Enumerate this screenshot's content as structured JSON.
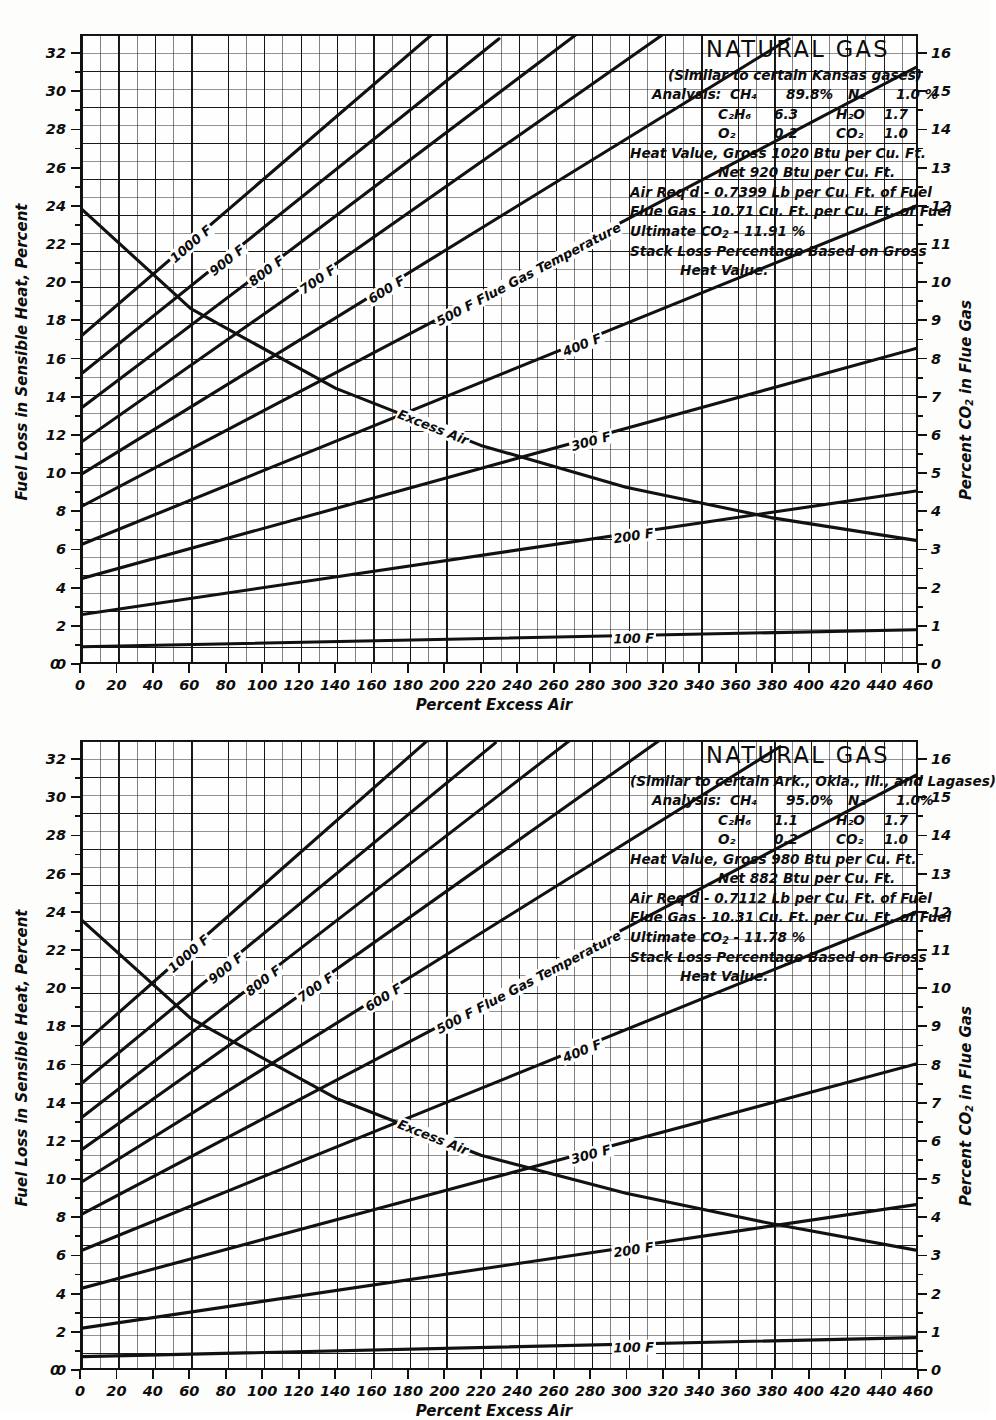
{
  "charts": [
    {
      "id": "chart-1",
      "title": "NATURAL GAS",
      "subtitle": "(Similar to certain Kansas gases)",
      "analysis_label": "Analysis:",
      "analysis": [
        {
          "sp1": "CH₄",
          "v1": "89.8%",
          "sp2": "N₂",
          "v2": "1.0 %"
        },
        {
          "sp1": "C₂H₆",
          "v1": "6.3",
          "sp2": "H₂O",
          "v2": "1.7"
        },
        {
          "sp1": "O₂",
          "v1": "0.2",
          "sp2": "CO₂",
          "v2": "1.0"
        }
      ],
      "heat_value_gross": "Heat Value, Gross  1020  Btu per Cu. Ft.",
      "heat_value_net": "Net    920  Btu per Cu. Ft.",
      "air_reqd": "Air Req'd - 0.7399 Lb per Cu. Ft. of Fuel",
      "flue_gas": "Flue Gas - 10.71 Cu. Ft. per Cu. Ft. of Fuel",
      "ultimate_co2": "Ultimate CO₂ - 11.91 %",
      "stack_loss_1": "Stack Loss Percentage Based on Gross",
      "stack_loss_2": "Heat Value.",
      "xlabel": "Percent Excess Air",
      "ylabel_left": "Fuel Loss in Sensible Heat, Percent",
      "ylabel_right": "Percent CO₂ in Flue Gas",
      "chart_data": {
        "type": "line",
        "title": "NATURAL GAS — Stack loss vs percent excess air (Kansas gases)",
        "xlabel": "Percent Excess Air",
        "ylabel": "Fuel Loss in Sensible Heat, Percent",
        "ylabel_secondary": "Percent CO2 in Flue Gas",
        "xlim": [
          0,
          460
        ],
        "ylim": [
          0,
          33
        ],
        "ylim_secondary": [
          0,
          16.5
        ],
        "xticks": [
          0,
          20,
          40,
          60,
          80,
          100,
          120,
          140,
          160,
          180,
          200,
          220,
          240,
          260,
          280,
          300,
          320,
          340,
          360,
          380,
          400,
          420,
          440,
          460
        ],
        "yticks_left": [
          0,
          2,
          4,
          6,
          8,
          10,
          12,
          14,
          16,
          18,
          20,
          22,
          24,
          26,
          28,
          30,
          32
        ],
        "yticks_right": [
          0,
          1,
          2,
          3,
          4,
          5,
          6,
          7,
          8,
          9,
          10,
          11,
          12,
          13,
          14,
          15,
          16
        ],
        "grid": true,
        "legend": "inline-curve-labels",
        "series": [
          {
            "name": "1000 F",
            "label": "1000 F",
            "axis": "left",
            "x": [
              0,
              200
            ],
            "y": [
              17.2,
              33.6
            ]
          },
          {
            "name": "900 F",
            "label": "900 F",
            "axis": "left",
            "x": [
              0,
              230
            ],
            "y": [
              15.2,
              32.8
            ]
          },
          {
            "name": "800 F",
            "label": "800 F",
            "axis": "left",
            "x": [
              0,
              275
            ],
            "y": [
              13.4,
              33.2
            ]
          },
          {
            "name": "700 F",
            "label": "700 F",
            "axis": "left",
            "x": [
              0,
              320
            ],
            "y": [
              11.6,
              33.0
            ]
          },
          {
            "name": "600 F",
            "label": "600 F",
            "axis": "left",
            "x": [
              0,
              390
            ],
            "y": [
              9.9,
              32.8
            ]
          },
          {
            "name": "500 F",
            "label": "500 F Flue Gas Temperature",
            "axis": "left",
            "x": [
              0,
              460
            ],
            "y": [
              8.2,
              31.3
            ]
          },
          {
            "name": "400 F",
            "label": "400 F",
            "axis": "left",
            "x": [
              0,
              460
            ],
            "y": [
              6.2,
              24.0
            ]
          },
          {
            "name": "300 F",
            "label": "300 F",
            "axis": "left",
            "x": [
              0,
              460
            ],
            "y": [
              4.4,
              16.5
            ]
          },
          {
            "name": "200 F",
            "label": "200 F",
            "axis": "left",
            "x": [
              0,
              460
            ],
            "y": [
              2.5,
              9.0
            ]
          },
          {
            "name": "100 F",
            "label": "100 F",
            "axis": "left",
            "x": [
              0,
              460
            ],
            "y": [
              0.8,
              1.7
            ]
          },
          {
            "name": "Excess Air (CO2)",
            "label": "Excess Air",
            "axis": "right",
            "x": [
              0,
              60,
              140,
              220,
              300,
              380,
              460
            ],
            "y": [
              11.91,
              9.3,
              7.2,
              5.7,
              4.6,
              3.8,
              3.2
            ]
          }
        ]
      }
    },
    {
      "id": "chart-2",
      "title": "NATURAL GAS",
      "subtitle": "(Similar to certain Ark., Okla., Ill., and Lagases)",
      "analysis_label": "Analysis:",
      "analysis": [
        {
          "sp1": "CH₄",
          "v1": "95.0%",
          "sp2": "N₂",
          "v2": "1.0%"
        },
        {
          "sp1": "C₂H₆",
          "v1": "1.1",
          "sp2": "H₂O",
          "v2": "1.7"
        },
        {
          "sp1": "O₂",
          "v1": "0.2",
          "sp2": "CO₂",
          "v2": "1.0"
        }
      ],
      "heat_value_gross": "Heat Value, Gross  980  Btu per Cu. Ft.",
      "heat_value_net": "Net    882  Btu per Cu. Ft.",
      "air_reqd": "Air Req'd - 0.7112 Lb per Cu. Ft. of Fuel",
      "flue_gas": "Flue Gas - 10.31 Cu. Ft. per Cu. Ft. of Fuel",
      "ultimate_co2": "Ultimate CO₂ - 11.78 %",
      "stack_loss_1": "Stack Loss Percentage Based on Gross",
      "stack_loss_2": "Heat Value.",
      "xlabel": "Percent Excess Air",
      "ylabel_left": "Fuel Loss in Sensible Heat, Percent",
      "ylabel_right": "Percent CO₂ in Flue Gas",
      "chart_data": {
        "type": "line",
        "title": "NATURAL GAS — Stack loss vs percent excess air (Ark., Okla., Ill., Lagas)",
        "xlabel": "Percent Excess Air",
        "ylabel": "Fuel Loss in Sensible Heat, Percent",
        "ylabel_secondary": "Percent CO2 in Flue Gas",
        "xlim": [
          0,
          460
        ],
        "ylim": [
          0,
          33
        ],
        "ylim_secondary": [
          0,
          16.5
        ],
        "xticks": [
          0,
          20,
          40,
          60,
          80,
          100,
          120,
          140,
          160,
          180,
          200,
          220,
          240,
          260,
          280,
          300,
          320,
          340,
          360,
          380,
          400,
          420,
          440,
          460
        ],
        "yticks_left": [
          0,
          2,
          4,
          6,
          8,
          10,
          12,
          14,
          16,
          18,
          20,
          22,
          24,
          26,
          28,
          30,
          32
        ],
        "yticks_right": [
          0,
          1,
          2,
          3,
          4,
          5,
          6,
          7,
          8,
          9,
          10,
          11,
          12,
          13,
          14,
          15,
          16
        ],
        "grid": true,
        "legend": "inline-curve-labels",
        "series": [
          {
            "name": "1000 F",
            "label": "1000 F",
            "axis": "left",
            "x": [
              0,
              195
            ],
            "y": [
              17.0,
              33.4
            ]
          },
          {
            "name": "900 F",
            "label": "900 F",
            "axis": "left",
            "x": [
              0,
              228
            ],
            "y": [
              15.0,
              32.9
            ]
          },
          {
            "name": "800 F",
            "label": "800 F",
            "axis": "left",
            "x": [
              0,
              270
            ],
            "y": [
              13.2,
              33.1
            ]
          },
          {
            "name": "700 F",
            "label": "700 F",
            "axis": "left",
            "x": [
              0,
              318
            ],
            "y": [
              11.5,
              33.0
            ]
          },
          {
            "name": "600 F",
            "label": "600 F",
            "axis": "left",
            "x": [
              0,
              385
            ],
            "y": [
              9.8,
              32.7
            ]
          },
          {
            "name": "500 F",
            "label": "500 F Flue Gas Temperature",
            "axis": "left",
            "x": [
              0,
              460
            ],
            "y": [
              8.1,
              31.2
            ]
          },
          {
            "name": "400 F",
            "label": "400 F",
            "axis": "left",
            "x": [
              0,
              460
            ],
            "y": [
              6.2,
              24.0
            ]
          },
          {
            "name": "300 F",
            "label": "300 F",
            "axis": "left",
            "x": [
              0,
              460
            ],
            "y": [
              4.2,
              16.0
            ]
          },
          {
            "name": "200 F",
            "label": "200 F",
            "axis": "left",
            "x": [
              0,
              460
            ],
            "y": [
              2.1,
              8.6
            ]
          },
          {
            "name": "100 F",
            "label": "100 F",
            "axis": "left",
            "x": [
              0,
              460
            ],
            "y": [
              0.6,
              1.6
            ]
          },
          {
            "name": "Excess Air (CO2)",
            "label": "Excess Air",
            "axis": "right",
            "x": [
              0,
              60,
              140,
              220,
              300,
              380,
              460
            ],
            "y": [
              11.78,
              9.2,
              7.1,
              5.6,
              4.6,
              3.8,
              3.1
            ]
          }
        ]
      }
    }
  ]
}
